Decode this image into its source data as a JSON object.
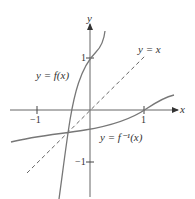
{
  "diagram": {
    "axes": {
      "x_label": "x",
      "y_label": "y",
      "x_ticks": [
        {
          "value": -1,
          "label": "−1"
        },
        {
          "value": 1,
          "label": "1"
        }
      ],
      "y_ticks": [
        {
          "value": 1,
          "label": "1"
        },
        {
          "value": -1,
          "label": "−1"
        }
      ]
    },
    "curves": [
      {
        "name": "f",
        "label": "y = f(x)",
        "style": "solid"
      },
      {
        "name": "f-inverse",
        "label": "y = f⁻¹(x)",
        "style": "solid"
      },
      {
        "name": "identity",
        "label": "y = x",
        "style": "dashed"
      }
    ],
    "colors": {
      "axis": "#333333",
      "curve": "#777777",
      "text": "#333333"
    }
  }
}
